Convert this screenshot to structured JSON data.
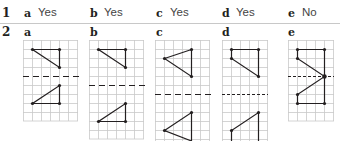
{
  "header_fragment": "",
  "question1": {
    "number": "1",
    "answers": [
      {
        "label": "a",
        "value": "Yes"
      },
      {
        "label": "b",
        "value": "Yes"
      },
      {
        "label": "c",
        "value": "Yes"
      },
      {
        "label": "d",
        "value": "Yes"
      },
      {
        "label": "e",
        "value": "No"
      }
    ]
  },
  "question2": {
    "number": "2",
    "panels": [
      {
        "label": "a"
      },
      {
        "label": "b"
      },
      {
        "label": "c"
      },
      {
        "label": "d"
      },
      {
        "label": "e"
      }
    ]
  },
  "colors": {
    "grid": "#c9c9c9",
    "line": "#231f20",
    "separator": "#c8c8c8"
  }
}
